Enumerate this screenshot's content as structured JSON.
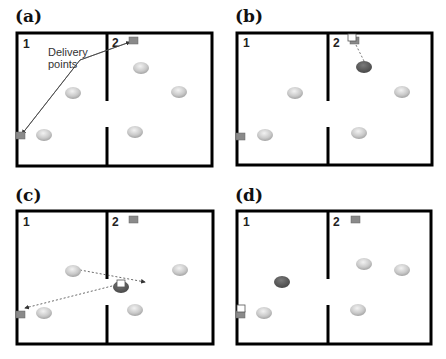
{
  "panels": [
    {
      "label": "(a)",
      "room1": "1",
      "room2": "2",
      "annotation_line1": "Delivery",
      "annotation_line2": "points"
    },
    {
      "label": "(b)",
      "room1": "1",
      "room2": "2"
    },
    {
      "label": "(c)",
      "room1": "1",
      "room2": "2"
    },
    {
      "label": "(d)",
      "room1": "1",
      "room2": "2"
    }
  ],
  "colors": {
    "wall": "#000000",
    "delivery_point": "#8a8a8a",
    "disk_light": "#c8c8c8",
    "disk_dark": "#555555",
    "path": "#444444"
  }
}
